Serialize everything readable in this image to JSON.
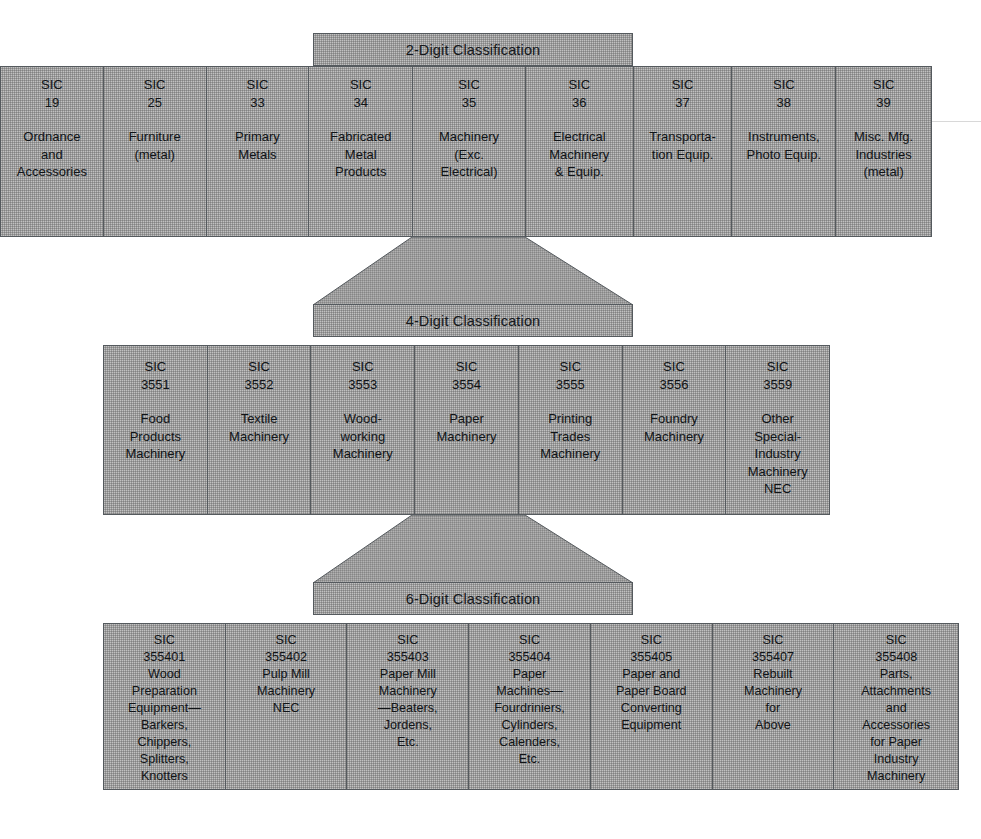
{
  "diagram": {
    "fill_color": "#9b9b9b",
    "border_color": "#555a5e",
    "text_color": "#101316",
    "background_color": "#ffffff"
  },
  "levels": [
    {
      "banner": "2-Digit Classification",
      "cells": [
        {
          "code": "SIC\n19",
          "name": "Ordnance\nand\nAccessories"
        },
        {
          "code": "SIC\n25",
          "name": "Furniture\n(metal)"
        },
        {
          "code": "SIC\n33",
          "name": "Primary\nMetals"
        },
        {
          "code": "SIC\n34",
          "name": "Fabricated\nMetal\nProducts"
        },
        {
          "code": "SIC\n35",
          "name": "Machinery\n(Exc.\nElectrical)"
        },
        {
          "code": "SIC\n36",
          "name": "Electrical\nMachinery\n& Equip."
        },
        {
          "code": "SIC\n37",
          "name": "Transporta-\ntion Equip."
        },
        {
          "code": "SIC\n38",
          "name": "Instruments,\nPhoto Equip."
        },
        {
          "code": "SIC\n39",
          "name": "Misc. Mfg.\nIndustries\n(metal)"
        }
      ]
    },
    {
      "banner": "4-Digit Classification",
      "cells": [
        {
          "code": "SIC\n3551",
          "name": "Food\nProducts\nMachinery"
        },
        {
          "code": "SIC\n3552",
          "name": "Textile\nMachinery"
        },
        {
          "code": "SIC\n3553",
          "name": "Wood-\nworking\nMachinery"
        },
        {
          "code": "SIC\n3554",
          "name": "Paper\nMachinery"
        },
        {
          "code": "SIC\n3555",
          "name": "Printing\nTrades\nMachinery"
        },
        {
          "code": "SIC\n3556",
          "name": "Foundry\nMachinery"
        },
        {
          "code": "SIC\n3559",
          "name": "Other\nSpecial-\nIndustry\nMachinery\nNEC"
        }
      ]
    },
    {
      "banner": "6-Digit Classification",
      "cells": [
        {
          "code": "SIC\n355401",
          "name": "Wood\nPreparation\nEquipment—\nBarkers,\nChippers,\nSplitters,\nKnotters"
        },
        {
          "code": "SIC\n355402",
          "name": "Pulp Mill\nMachinery\nNEC"
        },
        {
          "code": "SIC\n355403",
          "name": "Paper Mill\nMachinery\n—Beaters,\nJordens,\nEtc."
        },
        {
          "code": "SIC\n355404",
          "name": "Paper\nMachines—\nFourdriniers,\nCylinders,\nCalenders,\nEtc."
        },
        {
          "code": "SIC\n355405",
          "name": "Paper and\nPaper Board\nConverting\nEquipment"
        },
        {
          "code": "SIC\n355407",
          "name": "Rebuilt\nMachinery\nfor\nAbove"
        },
        {
          "code": "SIC\n355408",
          "name": "Parts,\nAttachments\nand\nAccessories\nfor Paper\nIndustry\nMachinery"
        }
      ]
    }
  ]
}
